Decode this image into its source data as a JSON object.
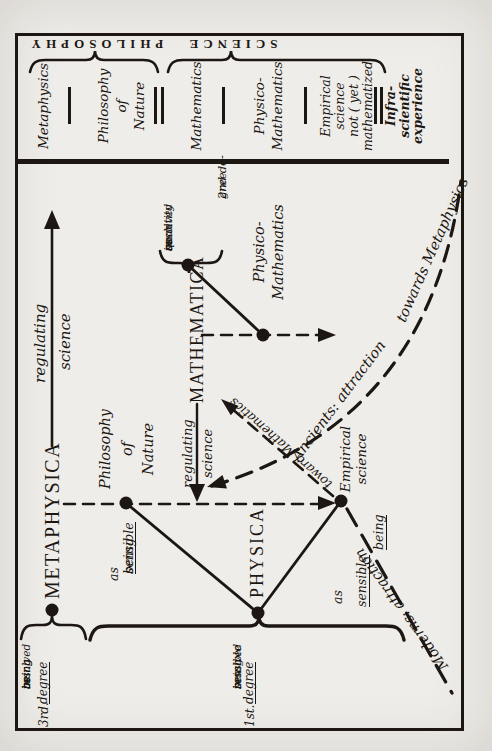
{
  "scan": {
    "ink": "#1c1713",
    "paper": "#efede9"
  },
  "table": {
    "bands": {
      "philosophy": "PHILOSOPHY",
      "science": "SCIENCE"
    },
    "rows": [
      {
        "lines": [
          "Metaphysics"
        ]
      },
      {
        "lines": [
          "Philosophy",
          "of",
          "Nature"
        ]
      },
      {
        "lines": [
          "Mathematics"
        ]
      },
      {
        "lines": [
          "Physico-",
          "Mathematics"
        ]
      },
      {
        "lines": [
          "Empirical",
          "science",
          "not ( yet )",
          "mathematized"
        ]
      },
      {
        "lines": [
          "Infra-",
          "scientific",
          "experience"
        ]
      }
    ]
  },
  "diagram": {
    "metaphysica": "METAPHYSICA",
    "mathematica": "MATHEMATICA",
    "physica": "PHYSICA",
    "regulating_big": {
      "line1": "regulating",
      "line2": "science"
    },
    "regulating_small": {
      "line1": "regulating",
      "line2": "science"
    },
    "philosophy_of_nature": {
      "line1": "Philosophy",
      "line2": "of",
      "line3": "Nature"
    },
    "empirical_science": {
      "line1": "Empirical",
      "line2": "science"
    },
    "physico_mathematics": {
      "line1": "Physico-",
      "line2": "Mathematics"
    },
    "degree3": {
      "num": "3rd.",
      "word": "degree",
      "resolved": [
        "resolved",
        "in",
        "being",
        "as",
        "being"
      ]
    },
    "degree1": {
      "num": "1st.",
      "word": "degree",
      "resolved": [
        "resolved",
        "in",
        "sensible",
        "being"
      ]
    },
    "degree2": {
      "num": "2nd de-",
      "word": "gree",
      "resolved": [
        "resolved",
        "in",
        "quantity",
        "as",
        "such"
      ]
    },
    "as_sensible_left": {
      "line1": "as",
      "line2": "sensible",
      "line3": "being"
    },
    "as_sensible_right": {
      "line1": "as",
      "line2": "sensible",
      "line3": "being"
    },
    "toward_mathematics": "toward Mathematics",
    "ancients": {
      "part1": "Ancients: attraction",
      "part2": "towards Metaphysics"
    },
    "moderns": "Moderns: attraction"
  }
}
